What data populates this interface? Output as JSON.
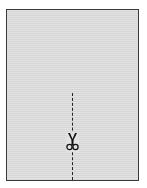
{
  "diagram": {
    "sheet": {
      "fill_color": "#dcdcdc",
      "border_color": "#3a3a3a"
    },
    "cut_line": {
      "style": "dashed",
      "orientation": "vertical",
      "color": "#222222"
    },
    "icon": {
      "name": "scissors-icon",
      "color": "#111111"
    }
  }
}
